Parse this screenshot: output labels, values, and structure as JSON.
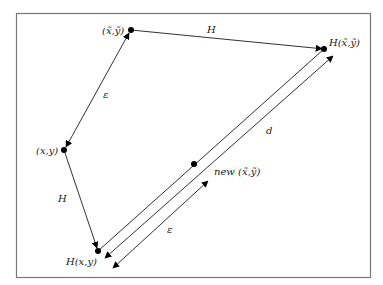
{
  "diagram": {
    "frame": {
      "x": 16,
      "y": 13,
      "width": 354,
      "height": 264,
      "stroke": "#777777"
    },
    "colors": {
      "line": "#1a1a1a",
      "point": "#000000"
    },
    "points": {
      "xt_yt": {
        "x": 131,
        "y": 30,
        "label": "(x̃,ỹ)"
      },
      "H_xt_yt": {
        "x": 324,
        "y": 49,
        "label": "H(x̃,ỹ)"
      },
      "x_y": {
        "x": 64,
        "y": 150,
        "label": "(x,y)"
      },
      "H_x_y": {
        "x": 98,
        "y": 251,
        "label": "H(x,y)"
      },
      "new_xt_yt": {
        "x": 194,
        "y": 164,
        "label": "new (x̃,ỹ)"
      }
    },
    "edge_labels": {
      "H_top": "H",
      "epsilon_left": "ε",
      "H_left": "H",
      "d": "d",
      "epsilon_bottom": "ε"
    }
  }
}
